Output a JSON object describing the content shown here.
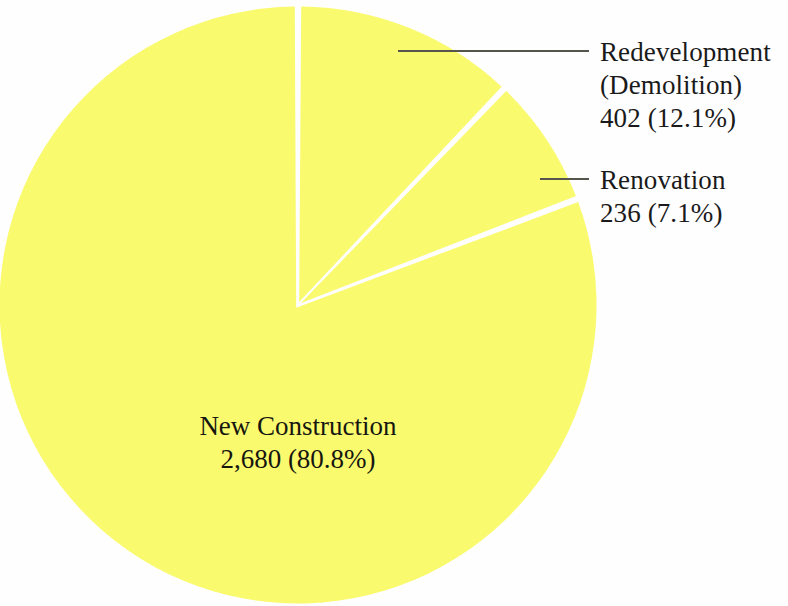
{
  "chart_data": {
    "type": "pie",
    "title": "",
    "subtitle": "",
    "xlabel": "",
    "ylabel": "",
    "legend_position": "none",
    "grid": false,
    "total": 3318,
    "start_angle_deg": 0,
    "direction": "clockwise",
    "categories": [
      "Redevelopment (Demolition)",
      "Renovation",
      "New Construction"
    ],
    "values": [
      402,
      236,
      2680
    ],
    "percentages": [
      12.1,
      7.1,
      80.8
    ],
    "slice_colors": [
      "#fafa6e",
      "#fafa6e",
      "#fafa6e"
    ],
    "separator_color": "#ffffff",
    "annotations": [
      {
        "name": "redevelopment",
        "value_label": "402 (12.1%)",
        "lines": [
          "Redevelopment",
          "(Demolition)",
          "402 (12.1%)"
        ],
        "placement": "outside",
        "leader": true
      },
      {
        "name": "renovation",
        "value_label": "236 (7.1%)",
        "lines": [
          "Renovation",
          "236 (7.1%)"
        ],
        "placement": "outside",
        "leader": true
      },
      {
        "name": "new_construction",
        "value_label": "2,680 (80.8%)",
        "lines": [
          "New Construction",
          "2,680 (80.8%)"
        ],
        "placement": "inside",
        "leader": false
      }
    ]
  },
  "chart": {
    "background_color": "#fefefe",
    "slice_fill": "#fafa6e",
    "text_color": "#1a1a1a",
    "leader_line_color": "#555550"
  },
  "labels": {
    "redevelopment": {
      "line1": "Redevelopment",
      "line2": "(Demolition)",
      "line3": "402 (12.1%)"
    },
    "renovation": {
      "line1": "Renovation",
      "line2": "236 (7.1%)"
    },
    "new_construction": {
      "line1": "New Construction",
      "line2": "2,680 (80.8%)"
    }
  }
}
